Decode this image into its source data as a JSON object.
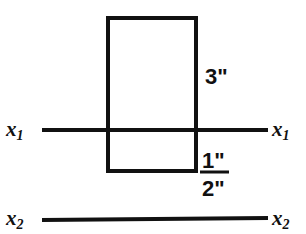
{
  "diagram": {
    "background_color": "#ffffff",
    "ink_color": "#111111",
    "shape": {
      "name": "rectangle",
      "x": 106,
      "y": 16,
      "width": 91,
      "height": 156,
      "stroke_width": 4
    },
    "axes": [
      {
        "id": "x1",
        "label_left": "x",
        "label_left_sub": "1",
        "label_right": "x",
        "label_right_sub": "1",
        "y": 130,
        "x_start": 42,
        "x_end": 268,
        "stroke_width": 4
      },
      {
        "id": "x2",
        "label_left": "x",
        "label_left_sub": "2",
        "label_right": "x",
        "label_right_sub": "2",
        "y": 219,
        "x_start": 42,
        "x_end": 268,
        "stroke_width": 4
      }
    ],
    "dimensions": {
      "height": "3\"",
      "flange": "1\"",
      "width": "2\""
    },
    "fraction_rule": {
      "x_start": 200,
      "x_end": 229,
      "y": 172,
      "stroke_width": 3
    }
  }
}
